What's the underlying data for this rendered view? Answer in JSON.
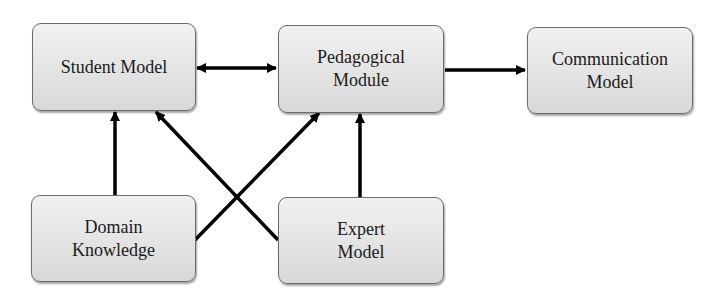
{
  "diagram": {
    "nodes": [
      {
        "id": "student_model",
        "lines": [
          "Student Model"
        ]
      },
      {
        "id": "pedagogical_module",
        "lines": [
          "Pedagogical",
          "Module"
        ]
      },
      {
        "id": "communication_model",
        "lines": [
          "Communication",
          "Model"
        ]
      },
      {
        "id": "domain_knowledge",
        "lines": [
          "Domain",
          "Knowledge"
        ]
      },
      {
        "id": "expert_model",
        "lines": [
          "Expert",
          "Model"
        ]
      }
    ],
    "edges": [
      {
        "from": "student_model",
        "to": "pedagogical_module",
        "direction": "bidirectional"
      },
      {
        "from": "pedagogical_module",
        "to": "communication_model",
        "direction": "forward"
      },
      {
        "from": "domain_knowledge",
        "to": "student_model",
        "direction": "forward"
      },
      {
        "from": "domain_knowledge",
        "to": "pedagogical_module",
        "direction": "forward"
      },
      {
        "from": "expert_model",
        "to": "student_model",
        "direction": "forward"
      },
      {
        "from": "expert_model",
        "to": "pedagogical_module",
        "direction": "forward"
      }
    ]
  }
}
